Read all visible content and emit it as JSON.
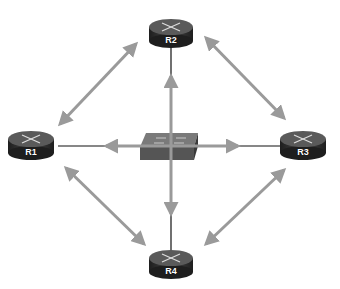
{
  "diagram": {
    "type": "network-topology",
    "colors": {
      "arrow": "#9a9a9a",
      "link": "#111111",
      "router_top": "#5a5a5a",
      "router_side": "#2b2b2b",
      "switch_top": "#6e6e6e",
      "switch_front": "#555555",
      "background": "#ffffff"
    },
    "nodes": [
      {
        "id": "R1",
        "label": "R1",
        "kind": "router"
      },
      {
        "id": "R2",
        "label": "R2",
        "kind": "router"
      },
      {
        "id": "R3",
        "label": "R3",
        "kind": "router"
      },
      {
        "id": "R4",
        "label": "R4",
        "kind": "router"
      },
      {
        "id": "SW",
        "label": "",
        "kind": "switch"
      }
    ],
    "links": [
      {
        "from": "SW",
        "to": "R1"
      },
      {
        "from": "SW",
        "to": "R2"
      },
      {
        "from": "SW",
        "to": "R3"
      },
      {
        "from": "SW",
        "to": "R4"
      }
    ],
    "adjacency_arrows": [
      {
        "from": "R1",
        "to": "R2"
      },
      {
        "from": "R2",
        "to": "R3"
      },
      {
        "from": "R3",
        "to": "R4"
      },
      {
        "from": "R4",
        "to": "R1"
      },
      {
        "from": "SW",
        "to": "R1"
      },
      {
        "from": "SW",
        "to": "R2"
      },
      {
        "from": "SW",
        "to": "R3"
      },
      {
        "from": "SW",
        "to": "R4"
      }
    ]
  }
}
